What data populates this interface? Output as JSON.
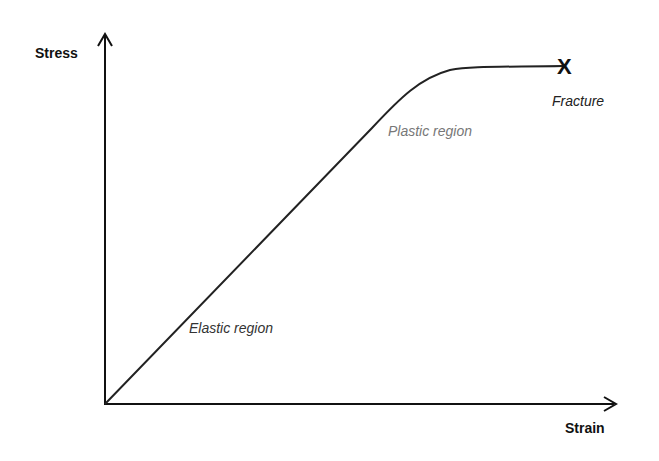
{
  "diagram": {
    "y_axis": {
      "label": "Stress"
    },
    "x_axis": {
      "label": "Strain"
    },
    "regions": [
      {
        "label": "Elastic region",
        "color": "#333333"
      },
      {
        "label": "Plastic region",
        "color": "#777777"
      }
    ],
    "fracture": {
      "mark": "X",
      "label": "Fracture"
    },
    "line_color": "#222222"
  }
}
